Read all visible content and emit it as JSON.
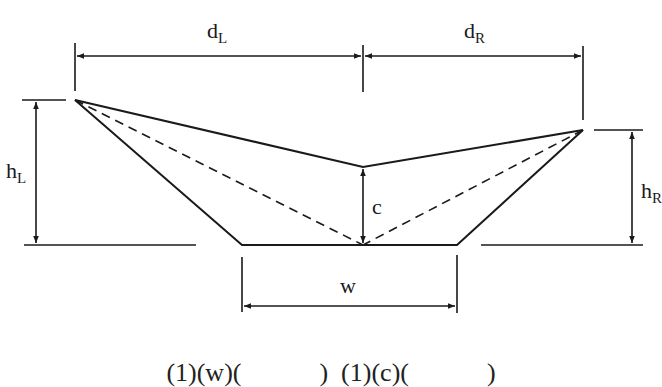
{
  "diagram": {
    "stroke_color": "#1a1a1a",
    "labels": {
      "dL": {
        "base": "d",
        "sub": "L"
      },
      "dR": {
        "base": "d",
        "sub": "R"
      },
      "hL": {
        "base": "h",
        "sub": "L"
      },
      "hR": {
        "base": "h",
        "sub": "R"
      },
      "c": "c",
      "w": "w"
    },
    "points": {
      "left_top": [
        75,
        100
      ],
      "center_top": [
        363,
        167
      ],
      "right_top": [
        583,
        130
      ],
      "bottom_left": [
        242,
        245
      ],
      "bottom_center": [
        363,
        245
      ],
      "bottom_right": [
        457,
        245
      ]
    },
    "formula_partial": "(1)(w)(            )  (1)(c)(            )"
  }
}
